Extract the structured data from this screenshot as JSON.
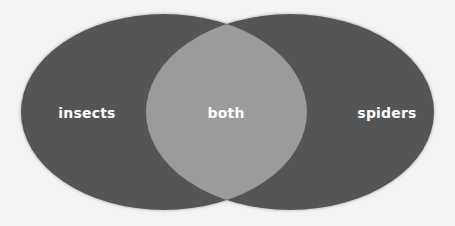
{
  "diagram": {
    "type": "venn",
    "sets": [
      {
        "id": "left",
        "label": "insects",
        "cx": 164,
        "cy": 112,
        "rx": 143,
        "ry": 98
      },
      {
        "id": "right",
        "label": "spiders",
        "cx": 290,
        "cy": 112,
        "rx": 144,
        "ry": 98
      }
    ],
    "intersection": {
      "label": "both"
    },
    "colors": {
      "background": "#f3f3f3",
      "set_fill": "#555555",
      "intersection_fill": "#9b9b9b",
      "label_text": "#ffffff"
    }
  }
}
